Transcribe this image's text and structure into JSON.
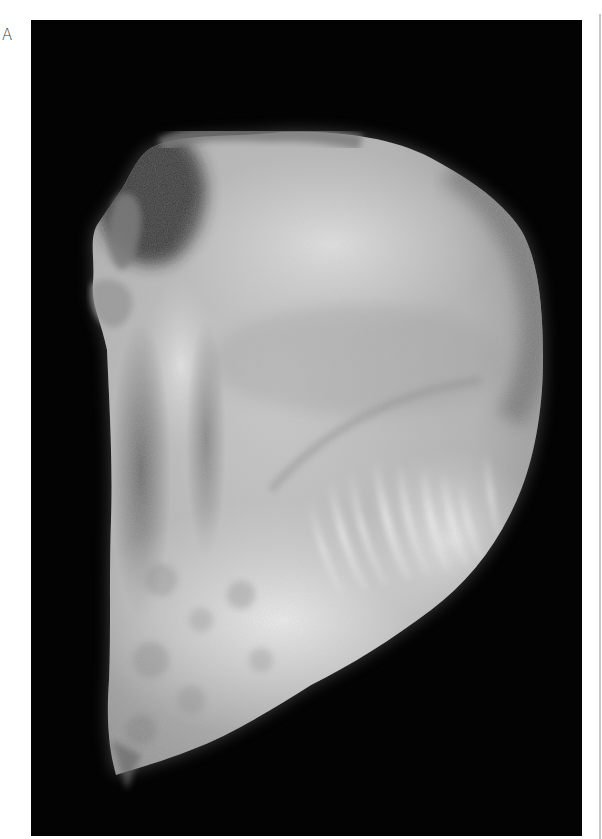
{
  "figure": {
    "panel_label": "A",
    "photo": {
      "subject": "grayscale photograph of a sectioned tissue specimen on black background",
      "background_color": "#030303",
      "specimen_tones": [
        "#f2f2f2",
        "#cfcfcf",
        "#a9a9a9",
        "#7a7a7a",
        "#4a4a4a"
      ]
    },
    "right_rule_color": "#c8c8c8"
  }
}
